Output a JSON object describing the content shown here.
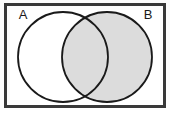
{
  "figure": {
    "type": "venn-2-set",
    "width": 172,
    "height": 115,
    "background_color": "#ffffff"
  },
  "universe": {
    "shape": "rectangle",
    "label": "",
    "border_color": "#3a3a3a",
    "border_width": 3,
    "fill_color": "#ffffff",
    "x": 4,
    "y": 3,
    "width": 162,
    "height": 105
  },
  "sets": [
    {
      "id": "A",
      "label": "A",
      "label_x": 23,
      "label_y": 19,
      "cx": 63,
      "cy": 57,
      "r": 45,
      "stroke_color": "#1a1a1a",
      "stroke_width": 2,
      "fill_color": "none",
      "shaded": false
    },
    {
      "id": "B",
      "label": "B",
      "label_x": 148,
      "label_y": 19,
      "cx": 107,
      "cy": 57,
      "r": 45,
      "stroke_color": "#1a1a1a",
      "stroke_width": 2,
      "fill_color": "#dcdcdc",
      "shaded": true
    }
  ],
  "regions": [
    {
      "id": "a-only",
      "name": "A minus B",
      "shaded": false,
      "fill_color": "#ffffff"
    },
    {
      "id": "intersection",
      "name": "A intersect B",
      "shaded": true,
      "fill_color": "#dcdcdc"
    },
    {
      "id": "b-only",
      "name": "B minus A",
      "shaded": true,
      "fill_color": "#dcdcdc"
    },
    {
      "id": "outside",
      "name": "Universe minus (A union B)",
      "shaded": false,
      "fill_color": "#ffffff"
    }
  ],
  "colors": {
    "shade": "#dcdcdc",
    "outline": "#1a1a1a",
    "frame": "#3a3a3a",
    "text": "#1a1a1a",
    "background": "#ffffff"
  }
}
